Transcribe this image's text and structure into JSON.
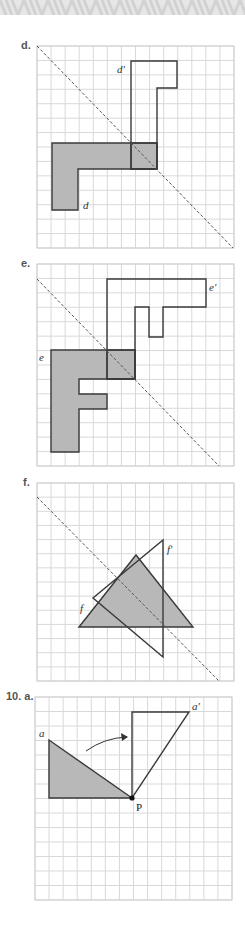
{
  "page": {
    "width": 245,
    "height": 933,
    "banner_color": "#e4e4e4"
  },
  "colors": {
    "grid_line": "#d9d9d9",
    "grid_border": "#cfcfcf",
    "shape_fill": "#b8b8b8",
    "shape_stroke": "#3a3a3a",
    "dashed_line": "#555555"
  },
  "panels": [
    {
      "id": "d",
      "label": "d.",
      "shape_label": "d",
      "image_label": "d'",
      "transformation": "reflection",
      "grid": {
        "x": 37,
        "y": 46,
        "width": 197,
        "height": 202,
        "cols": 14,
        "rows": 14
      },
      "mirror_line": {
        "x1": 37,
        "y1": 46,
        "x2": 233,
        "y2": 248
      },
      "shape_points": "52,143 157,143 157,169 78,169 78,210 52,210",
      "image_points": "131,61 177,61 177,88 157,88 157,169 131,169",
      "overlap_box": {
        "x": 131,
        "y": 143,
        "w": 26,
        "h": 26
      },
      "shape_label_pos": {
        "x": 83,
        "y": 209
      },
      "image_label_pos": {
        "x": 117,
        "y": 73
      }
    },
    {
      "id": "e",
      "label": "e.",
      "shape_label": "e",
      "image_label": "e'",
      "transformation": "reflection",
      "grid": {
        "x": 37,
        "y": 264,
        "width": 197,
        "height": 202,
        "cols": 14,
        "rows": 14
      },
      "mirror_line": {
        "x1": 37,
        "y1": 279,
        "x2": 219,
        "y2": 466
      },
      "shape_points": "51,350 135,350 135,379 79,379 79,394 107,394 107,409 79,409 79,452 51,452",
      "image_points": "107,279 206,279 206,307 163,307 163,337 149,337 149,307 135,307 135,379 107,379",
      "overlap_box": {
        "x": 107,
        "y": 350,
        "w": 28,
        "h": 29
      },
      "shape_label_pos": {
        "x": 39,
        "y": 361
      },
      "image_label_pos": {
        "x": 209,
        "y": 291
      }
    },
    {
      "id": "f",
      "label": "f.",
      "shape_label": "f",
      "image_label": "f'",
      "transformation": "reflection",
      "grid": {
        "x": 37,
        "y": 483,
        "width": 197,
        "height": 198,
        "cols": 14,
        "rows": 14
      },
      "mirror_line": {
        "x1": 37,
        "y1": 497,
        "x2": 219,
        "y2": 681
      },
      "shape_points": "79,627 136,555 193,627",
      "image_points": "163,540 163,657 93,598",
      "shape_label_pos": {
        "x": 80,
        "y": 612
      },
      "image_label_pos": {
        "x": 167,
        "y": 553
      }
    },
    {
      "id": "10a",
      "label": "10. a.",
      "shape_label": "a",
      "image_label": "a'",
      "point_label": "P",
      "transformation": "rotation",
      "grid": {
        "x": 35,
        "y": 697,
        "width": 197,
        "height": 203,
        "cols": 14,
        "rows": 14
      },
      "shape_points": "49,740 49,798 132,798",
      "image_points": "132,798 132,712 189,712",
      "pivot": {
        "x": 132,
        "y": 798
      },
      "rotation_arrow": {
        "path": "M 86 751 Q 104 738 127 737",
        "head": "128,737 121,733 122,741"
      },
      "shape_label_pos": {
        "x": 39,
        "y": 737
      },
      "image_label_pos": {
        "x": 192,
        "y": 710
      },
      "point_label_pos": {
        "x": 136,
        "y": 811
      }
    }
  ]
}
